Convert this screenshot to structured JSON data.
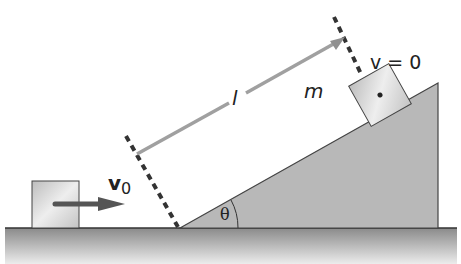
{
  "diagram": {
    "type": "physics-incline",
    "labels": {
      "length": "l",
      "mass": "m",
      "final_velocity": "v = 0",
      "initial_velocity_symbol": "v",
      "initial_velocity_subscript": "0",
      "angle": "θ"
    },
    "colors": {
      "ground_top": "#8a8a8a",
      "ground_bottom": "#e6e6e6",
      "incline_fill": "#b5b5b5",
      "block_fill": "#d6d6d6",
      "arrow": "#555555",
      "length_line": "#a0a0a0",
      "dashes": "#333333"
    }
  }
}
